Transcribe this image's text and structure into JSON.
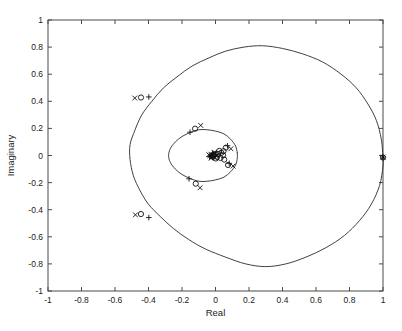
{
  "chart_data": {
    "type": "scatter",
    "title": "",
    "subtitle": "",
    "xlabel": "Real",
    "ylabel": "Imaginary",
    "xlim": [
      -1,
      1
    ],
    "ylim": [
      -1,
      1
    ],
    "grid": false,
    "legend": "none",
    "xticks": [
      -1,
      -0.8,
      -0.6,
      -0.4,
      -0.2,
      0,
      0.2,
      0.4,
      0.6,
      0.8,
      1
    ],
    "yticks": [
      -1,
      -0.8,
      -0.6,
      -0.4,
      -0.2,
      0,
      0.2,
      0.4,
      0.6,
      0.8,
      1
    ],
    "xtick_labels": [
      "-1",
      "-0.8",
      "-0.6",
      "-0.4",
      "-0.2",
      "0",
      "0.2",
      "0.4",
      "0.6",
      "0.8",
      "1"
    ],
    "ytick_labels": [
      "-1",
      "-0.8",
      "-0.6",
      "-0.4",
      "-0.2",
      "0",
      "0.2",
      "0.4",
      "0.6",
      "0.8",
      "1"
    ],
    "annotations": [],
    "series": [
      {
        "name": "outer-locus-curve",
        "type": "line",
        "marker": "none",
        "points": [
          [
            1.0,
            -0.02
          ],
          [
            0.99,
            0.12
          ],
          [
            0.96,
            0.26
          ],
          [
            0.91,
            0.38
          ],
          [
            0.84,
            0.5
          ],
          [
            0.75,
            0.6
          ],
          [
            0.64,
            0.69
          ],
          [
            0.52,
            0.75
          ],
          [
            0.4,
            0.79
          ],
          [
            0.28,
            0.81
          ],
          [
            0.17,
            0.8
          ],
          [
            0.06,
            0.77
          ],
          [
            -0.04,
            0.72
          ],
          [
            -0.14,
            0.66
          ],
          [
            -0.23,
            0.58
          ],
          [
            -0.31,
            0.5
          ],
          [
            -0.38,
            0.4
          ],
          [
            -0.44,
            0.3
          ],
          [
            -0.48,
            0.19
          ],
          [
            -0.51,
            0.08
          ],
          [
            -0.51,
            -0.03
          ],
          [
            -0.49,
            -0.15
          ],
          [
            -0.45,
            -0.26
          ],
          [
            -0.4,
            -0.36
          ],
          [
            -0.33,
            -0.45
          ],
          [
            -0.25,
            -0.54
          ],
          [
            -0.16,
            -0.62
          ],
          [
            -0.06,
            -0.69
          ],
          [
            0.06,
            -0.75
          ],
          [
            0.18,
            -0.8
          ],
          [
            0.3,
            -0.82
          ],
          [
            0.42,
            -0.8
          ],
          [
            0.54,
            -0.75
          ],
          [
            0.66,
            -0.68
          ],
          [
            0.77,
            -0.59
          ],
          [
            0.86,
            -0.48
          ],
          [
            0.93,
            -0.36
          ],
          [
            0.98,
            -0.22
          ],
          [
            1.0,
            -0.08
          ],
          [
            1.0,
            -0.02
          ]
        ]
      },
      {
        "name": "inner-locus-curve",
        "type": "line",
        "marker": "none",
        "points": [
          [
            0.13,
            0.02
          ],
          [
            0.12,
            0.07
          ],
          [
            0.09,
            0.12
          ],
          [
            0.05,
            0.16
          ],
          [
            0.0,
            0.18
          ],
          [
            -0.05,
            0.19
          ],
          [
            -0.1,
            0.19
          ],
          [
            -0.15,
            0.17
          ],
          [
            -0.2,
            0.14
          ],
          [
            -0.24,
            0.1
          ],
          [
            -0.27,
            0.05
          ],
          [
            -0.28,
            0.0
          ],
          [
            -0.27,
            -0.05
          ],
          [
            -0.24,
            -0.1
          ],
          [
            -0.2,
            -0.14
          ],
          [
            -0.15,
            -0.17
          ],
          [
            -0.1,
            -0.19
          ],
          [
            -0.05,
            -0.19
          ],
          [
            0.0,
            -0.18
          ],
          [
            0.05,
            -0.16
          ],
          [
            0.09,
            -0.12
          ],
          [
            0.12,
            -0.07
          ],
          [
            0.13,
            -0.02
          ],
          [
            0.13,
            0.02
          ]
        ]
      },
      {
        "name": "zeros-circle-markers",
        "type": "scatter",
        "marker": "o",
        "points": [
          [
            -0.445,
            0.428
          ],
          [
            -0.122,
            0.198
          ],
          [
            0.062,
            0.058
          ],
          [
            0.075,
            -0.07
          ],
          [
            -0.118,
            -0.208
          ],
          [
            -0.445,
            -0.432
          ],
          [
            1.0,
            -0.015
          ],
          [
            0.035,
            0.02
          ],
          [
            0.03,
            -0.018
          ],
          [
            0.015,
            0.012
          ],
          [
            0.01,
            -0.01
          ],
          [
            0.045,
            0.002
          ],
          [
            -0.005,
            0.008
          ],
          [
            -0.012,
            -0.004
          ],
          [
            0.052,
            -0.03
          ],
          [
            0.048,
            0.032
          ],
          [
            0.002,
            -0.022
          ],
          [
            0.022,
            0.034
          ]
        ]
      },
      {
        "name": "poles-x-markers",
        "type": "scatter",
        "marker": "x",
        "points": [
          [
            -0.482,
            0.424
          ],
          [
            -0.088,
            0.222
          ],
          [
            0.092,
            0.05
          ],
          [
            0.105,
            -0.078
          ],
          [
            -0.092,
            -0.238
          ],
          [
            -0.478,
            -0.438
          ],
          [
            1.0,
            -0.012
          ],
          [
            -0.018,
            0.0
          ],
          [
            -0.028,
            0.01
          ],
          [
            -0.022,
            -0.012
          ],
          [
            -0.008,
            0.018
          ],
          [
            -0.034,
            -0.002
          ],
          [
            -0.012,
            0.006
          ],
          [
            -0.002,
            -0.016
          ],
          [
            0.008,
            0.002
          ],
          [
            -0.04,
            0.006
          ],
          [
            -0.026,
            -0.02
          ],
          [
            -0.006,
            0.024
          ]
        ]
      },
      {
        "name": "plus-markers",
        "type": "scatter",
        "marker": "+",
        "points": [
          [
            -0.398,
            0.432
          ],
          [
            -0.152,
            0.172
          ],
          [
            0.072,
            0.072
          ],
          [
            0.082,
            -0.058
          ],
          [
            -0.158,
            -0.172
          ],
          [
            -0.398,
            -0.458
          ],
          [
            1.0,
            -0.012
          ],
          [
            -0.026,
            0.0
          ],
          [
            -0.014,
            0.012
          ],
          [
            -0.02,
            -0.012
          ],
          [
            0.0,
            0.006
          ],
          [
            -0.036,
            -0.008
          ]
        ]
      }
    ]
  }
}
